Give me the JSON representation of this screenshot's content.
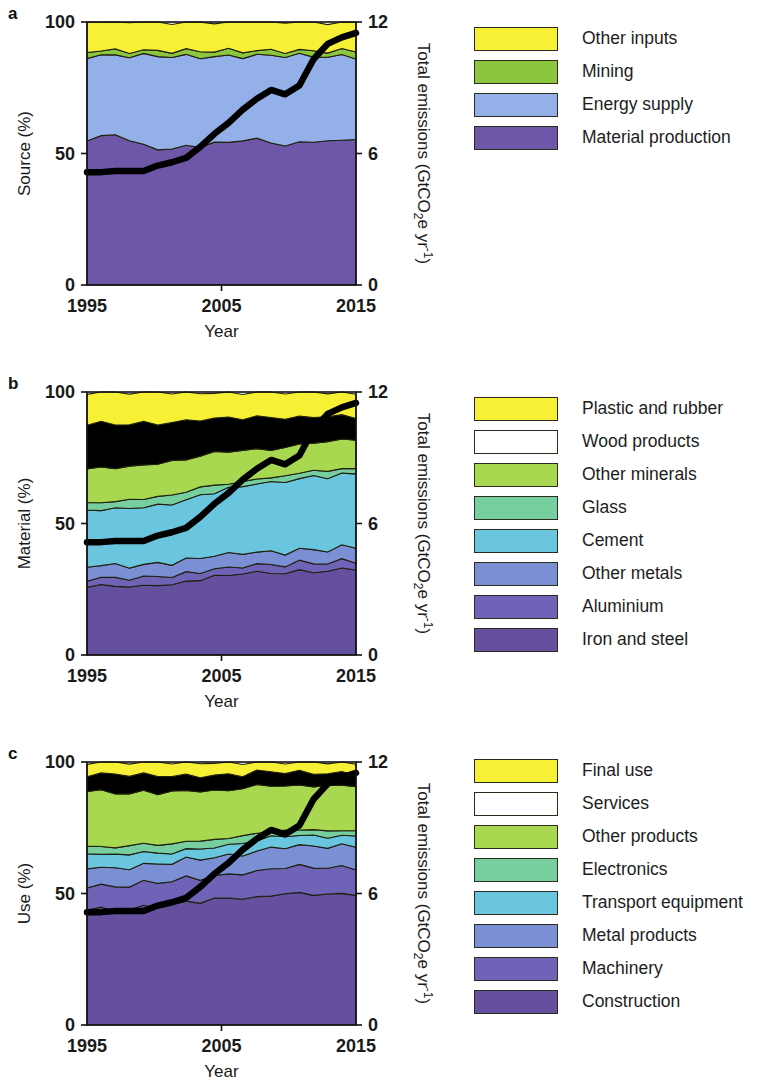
{
  "figure": {
    "x_axis_title": "Year",
    "x_ticks": [
      "1995",
      "2005",
      "2015"
    ],
    "y_left_ticks": [
      "100",
      "50",
      "0"
    ],
    "y_right_ticks": [
      "12",
      "6",
      "0"
    ],
    "right_axis_title_main": "Total emissions (GtCO",
    "right_axis_title_sub": "2",
    "right_axis_title_mid": "e yr",
    "right_axis_title_sup": "-1",
    "right_axis_title_end": ")"
  },
  "panels": [
    {
      "letter": "a",
      "y_left_title": "Source (%)",
      "legend": [
        {
          "label": "Other inputs",
          "color": "#f7f035"
        },
        {
          "label": "Mining",
          "color": "#8cc63f"
        },
        {
          "label": "Energy supply",
          "color": "#93b0e8"
        },
        {
          "label": "Material production",
          "color": "#6e57a8"
        }
      ]
    },
    {
      "letter": "b",
      "y_left_title": "Material (%)",
      "legend": [
        {
          "label": "Plastic and rubber",
          "color": "#f7f035"
        },
        {
          "label": "Wood products",
          "color": "#f8c council"
        },
        {
          "label": "Other minerals",
          "color": "#a7d84f"
        },
        {
          "label": "Glass",
          "color": "#77cfa0"
        },
        {
          "label": "Cement",
          "color": "#69c6de"
        },
        {
          "label": "Other metals",
          "color": "#7a8fd4"
        },
        {
          "label": "Aluminium",
          "color": "#6f63b8"
        },
        {
          "label": "Iron and steel",
          "color": "#65509f"
        }
      ]
    },
    {
      "letter": "c",
      "y_left_title": "Use (%)",
      "legend": [
        {
          "label": "Final use",
          "color": "#f7f035"
        },
        {
          "label": "Services",
          "color": "#f8c council"
        },
        {
          "label": "Other products",
          "color": "#a7d84f"
        },
        {
          "label": "Electronics",
          "color": "#77cfa0"
        },
        {
          "label": "Transport equipment",
          "color": "#69c6de"
        },
        {
          "label": "Metal products",
          "color": "#7a8fd4"
        },
        {
          "label": "Machinery",
          "color": "#6f63b8"
        },
        {
          "label": "Construction",
          "color": "#65509f"
        }
      ]
    }
  ],
  "chart_data": [
    {
      "type": "area",
      "panel": "a",
      "title": "Source shares of global emissions",
      "xlabel": "Year",
      "ylabel": "Source (%)",
      "y2label": "Total emissions (GtCO2e yr-1)",
      "xlim": [
        1995,
        2015
      ],
      "ylim": [
        0,
        100
      ],
      "y2lim": [
        0,
        12
      ],
      "grid": false,
      "stack_order_bottom_to_top": [
        "Material production",
        "Energy supply",
        "Mining",
        "Other inputs"
      ],
      "x": [
        1995,
        1996,
        1997,
        1998,
        1999,
        2000,
        2001,
        2002,
        2003,
        2004,
        2005,
        2006,
        2007,
        2008,
        2009,
        2010,
        2011,
        2012,
        2013,
        2014
      ],
      "series": [
        {
          "name": "Material production",
          "color": "#6e57a8",
          "values": [
            55,
            56,
            57,
            55,
            53,
            52,
            52,
            53,
            53,
            54,
            54,
            55,
            55,
            54,
            53,
            54,
            55,
            55,
            55,
            56
          ]
        },
        {
          "name": "Energy supply",
          "color": "#93b0e8",
          "values": [
            32,
            31,
            30,
            32,
            34,
            35,
            35,
            34,
            34,
            33,
            33,
            32,
            32,
            33,
            34,
            33,
            32,
            32,
            32,
            31
          ]
        },
        {
          "name": "Mining",
          "color": "#8cc63f",
          "values": [
            2,
            2,
            2,
            2,
            2,
            2,
            2,
            2,
            2,
            2,
            2,
            2,
            2,
            2,
            2,
            2,
            2,
            2,
            2,
            2
          ]
        },
        {
          "name": "Other inputs",
          "color": "#f7f035",
          "values": [
            11,
            11,
            11,
            11,
            11,
            11,
            11,
            11,
            11,
            11,
            11,
            11,
            11,
            11,
            11,
            11,
            11,
            11,
            11,
            11
          ]
        }
      ],
      "line_series": {
        "name": "Total emissions",
        "color": "#000000",
        "axis": "right",
        "unit": "GtCO2e yr-1",
        "values": [
          5.15,
          5.15,
          5.2,
          5.2,
          5.2,
          5.45,
          5.6,
          5.8,
          6.3,
          6.9,
          7.4,
          8.0,
          8.5,
          8.9,
          8.7,
          9.1,
          10.3,
          11.0,
          11.3,
          11.5
        ]
      }
    },
    {
      "type": "area",
      "panel": "b",
      "title": "Material shares of global emissions",
      "xlabel": "Year",
      "ylabel": "Material (%)",
      "y2label": "Total emissions (GtCO2e yr-1)",
      "xlim": [
        1995,
        2015
      ],
      "ylim": [
        0,
        100
      ],
      "y2lim": [
        0,
        12
      ],
      "grid": false,
      "stack_order_bottom_to_top": [
        "Iron and steel",
        "Aluminium",
        "Other metals",
        "Cement",
        "Glass",
        "Other minerals",
        "Wood products",
        "Plastic and rubber"
      ],
      "x": [
        1995,
        1996,
        1997,
        1998,
        1999,
        2000,
        2001,
        2002,
        2003,
        2004,
        2005,
        2006,
        2007,
        2008,
        2009,
        2010,
        2011,
        2012,
        2013,
        2014
      ],
      "series": [
        {
          "name": "Iron and steel",
          "color": "#65509f",
          "values": [
            26,
            26,
            26,
            26,
            26,
            27,
            27,
            28,
            29,
            30,
            30,
            31,
            31,
            31,
            31,
            32,
            32,
            32,
            33,
            33
          ]
        },
        {
          "name": "Aluminium",
          "color": "#6f63b8",
          "values": [
            3,
            3,
            3,
            3,
            3,
            3,
            3,
            3,
            3,
            3,
            3,
            3,
            3,
            3,
            3,
            3,
            3,
            3,
            3,
            3
          ]
        },
        {
          "name": "Other metals",
          "color": "#7a8fd4",
          "values": [
            5,
            5,
            5,
            5,
            5,
            5,
            5,
            5,
            5,
            5,
            5,
            5,
            5,
            5,
            5,
            5,
            5,
            5,
            5,
            5
          ]
        },
        {
          "name": "Cement",
          "color": "#69c6de",
          "values": [
            21,
            21,
            21,
            22,
            22,
            22,
            23,
            23,
            24,
            24,
            25,
            25,
            26,
            26,
            27,
            27,
            28,
            28,
            28,
            28
          ]
        },
        {
          "name": "Glass",
          "color": "#77cfa0",
          "values": [
            3,
            3,
            3,
            3,
            3,
            3,
            3,
            3,
            3,
            3,
            2,
            2,
            2,
            2,
            2,
            2,
            2,
            2,
            2,
            2
          ]
        },
        {
          "name": "Other minerals",
          "color": "#a7d84f",
          "values": [
            13,
            13,
            13,
            13,
            13,
            13,
            13,
            12,
            12,
            12,
            12,
            12,
            11,
            11,
            11,
            11,
            11,
            11,
            11,
            11
          ]
        },
        {
          "name": "Wood products",
          "color": "#f8c council",
          "values": [
            17,
            17,
            16,
            16,
            16,
            15,
            15,
            15,
            14,
            13,
            13,
            12,
            12,
            12,
            11,
            10,
            10,
            10,
            9,
            9
          ]
        },
        {
          "name": "Plastic and rubber",
          "color": "#f7f035",
          "values": [
            12,
            12,
            13,
            12,
            12,
            12,
            11,
            11,
            10,
            10,
            10,
            10,
            10,
            10,
            10,
            10,
            9,
            9,
            9,
            9
          ]
        }
      ],
      "line_series": {
        "name": "Total emissions",
        "color": "#000000",
        "axis": "right",
        "unit": "GtCO2e yr-1",
        "values": [
          5.15,
          5.15,
          5.2,
          5.2,
          5.2,
          5.45,
          5.6,
          5.8,
          6.3,
          6.9,
          7.4,
          8.0,
          8.5,
          8.9,
          8.7,
          9.1,
          10.3,
          11.0,
          11.3,
          11.5
        ]
      }
    },
    {
      "type": "area",
      "panel": "c",
      "title": "End-use shares of global emissions",
      "xlabel": "Year",
      "ylabel": "Use (%)",
      "y2label": "Total emissions (GtCO2e yr-1)",
      "xlim": [
        1995,
        2015
      ],
      "ylim": [
        0,
        100
      ],
      "y2lim": [
        0,
        12
      ],
      "grid": false,
      "stack_order_bottom_to_top": [
        "Construction",
        "Machinery",
        "Metal products",
        "Transport equipment",
        "Electronics",
        "Other products",
        "Services",
        "Final use"
      ],
      "x": [
        1995,
        1996,
        1997,
        1998,
        1999,
        2000,
        2001,
        2002,
        2003,
        2004,
        2005,
        2006,
        2007,
        2008,
        2009,
        2010,
        2011,
        2012,
        2013,
        2014
      ],
      "series": [
        {
          "name": "Construction",
          "color": "#65509f",
          "values": [
            44,
            44,
            43,
            44,
            45,
            45,
            46,
            47,
            47,
            48,
            48,
            48,
            48,
            49,
            50,
            50,
            50,
            50,
            50,
            50
          ]
        },
        {
          "name": "Machinery",
          "color": "#6f63b8",
          "values": [
            9,
            9,
            9,
            9,
            9,
            9,
            9,
            9,
            9,
            9,
            9,
            10,
            10,
            10,
            10,
            10,
            10,
            10,
            10,
            10
          ]
        },
        {
          "name": "Metal products",
          "color": "#7a8fd4",
          "values": [
            7,
            7,
            7,
            7,
            7,
            7,
            7,
            7,
            7,
            7,
            7,
            7,
            8,
            8,
            8,
            8,
            8,
            8,
            8,
            8
          ]
        },
        {
          "name": "Transport equipment",
          "color": "#69c6de",
          "values": [
            5,
            5,
            5,
            5,
            5,
            4,
            4,
            4,
            4,
            4,
            4,
            4,
            4,
            4,
            4,
            4,
            4,
            4,
            4,
            4
          ]
        },
        {
          "name": "Electronics",
          "color": "#77cfa0",
          "values": [
            3,
            3,
            3,
            3,
            3,
            3,
            3,
            3,
            3,
            3,
            3,
            3,
            3,
            2,
            2,
            2,
            2,
            2,
            2,
            2
          ]
        },
        {
          "name": "Other products",
          "color": "#a7d84f",
          "values": [
            21,
            21,
            21,
            20,
            20,
            20,
            20,
            19,
            19,
            18,
            18,
            18,
            18,
            18,
            17,
            17,
            17,
            17,
            17,
            17
          ]
        },
        {
          "name": "Services",
          "color": "#f8c council",
          "values": [
            6,
            6,
            7,
            7,
            6,
            7,
            6,
            6,
            6,
            6,
            6,
            5,
            5,
            5,
            5,
            5,
            5,
            5,
            5,
            5
          ]
        },
        {
          "name": "Final use",
          "color": "#f7f035",
          "values": [
            5,
            5,
            5,
            5,
            5,
            5,
            5,
            5,
            5,
            5,
            5,
            5,
            4,
            4,
            4,
            4,
            4,
            4,
            4,
            4
          ]
        }
      ],
      "line_series": {
        "name": "Total emissions",
        "color": "#000000",
        "axis": "right",
        "unit": "GtCO2e yr-1",
        "values": [
          5.15,
          5.15,
          5.2,
          5.2,
          5.2,
          5.45,
          5.6,
          5.8,
          6.3,
          6.9,
          7.4,
          8.0,
          8.5,
          8.9,
          8.7,
          9.1,
          10.3,
          11.0,
          11.3,
          11.5
        ]
      }
    }
  ]
}
